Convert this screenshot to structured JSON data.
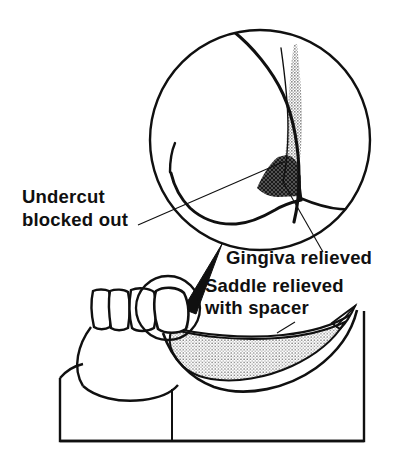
{
  "figure": {
    "type": "line-diagram",
    "background_color": "#ffffff",
    "ink_color": "#101010"
  },
  "labels": {
    "undercut": {
      "line1": "Undercut",
      "line2": "blocked out",
      "x": 22,
      "y1": 203,
      "y2": 226,
      "anchor": "start",
      "points_to": "blocked-out-wedge"
    },
    "gingiva": {
      "line1": "Gingiva relieved",
      "x": 226,
      "y1": 264,
      "anchor": "start",
      "points_to": "gingiva-relief-hatch"
    },
    "saddle": {
      "line1": "Saddle relieved",
      "line2": "with spacer",
      "x": 205,
      "y1": 292,
      "y2": 314,
      "anchor": "start",
      "points_to": "saddle-spacer-stipple"
    }
  },
  "inset": {
    "name": "magnified-detail-circle",
    "center_x": 260,
    "center_y": 140,
    "radius": 111,
    "contents": [
      "tooth-profile-curve",
      "blocked-out-wedge",
      "gingiva-relief-hatch",
      "denture-flange-outline"
    ]
  },
  "cast": {
    "name": "lower-cast-side-view",
    "teeth_count": 4,
    "regions": [
      "remaining-teeth",
      "saddle-spacer-stipple",
      "alveolar-ridge",
      "cast-base-block"
    ],
    "magnifier_circle": {
      "center_x": 168,
      "center_y": 308,
      "radius": 32
    }
  },
  "shading": {
    "blocked_out_fill": "#c9c9c9",
    "gingiva_relief_fill": "#2b2b2b",
    "saddle_spacer_fill": "#d5d5d5",
    "wedge_connector_fill": "#101010",
    "outline_color": "#101010"
  }
}
